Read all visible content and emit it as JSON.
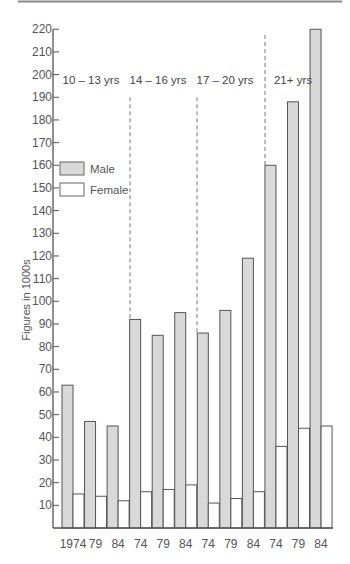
{
  "chart_data": {
    "type": "bar",
    "title": "",
    "xlabel": "",
    "ylabel": "Figures in 1000s",
    "ylim": [
      0,
      220
    ],
    "yticks": [
      10,
      20,
      30,
      40,
      50,
      60,
      70,
      80,
      90,
      100,
      110,
      120,
      130,
      140,
      150,
      160,
      170,
      180,
      190,
      200,
      210,
      220
    ],
    "grid": false,
    "legend_position": "upper-left",
    "categories": [
      "1974",
      "79",
      "84",
      "74",
      "79",
      "84",
      "74",
      "79",
      "84",
      "74",
      "79",
      "84"
    ],
    "groups": [
      {
        "label": "10 – 13 yrs",
        "categories": [
          "1974",
          "79",
          "84"
        ]
      },
      {
        "label": "14 – 16 yrs",
        "categories": [
          "74",
          "79",
          "84"
        ]
      },
      {
        "label": "17 – 20 yrs",
        "categories": [
          "74",
          "79",
          "84"
        ]
      },
      {
        "label": "21+ yrs",
        "categories": [
          "74",
          "79",
          "84"
        ]
      }
    ],
    "series": [
      {
        "name": "Male",
        "color": "#d9d9d9",
        "values": [
          63,
          47,
          45,
          92,
          85,
          95,
          86,
          96,
          119,
          160,
          188,
          220
        ]
      },
      {
        "name": "Female",
        "color": "#ffffff",
        "values": [
          15,
          14,
          12,
          16,
          17,
          19,
          11,
          13,
          16,
          36,
          44,
          45
        ]
      }
    ]
  },
  "legend": {
    "male_label": "Male",
    "female_label": "Female"
  },
  "colors": {
    "axis": "#555555",
    "male_fill": "#d9d9d9",
    "female_fill": "#ffffff",
    "bar_stroke": "#555555",
    "divider": "#777777"
  }
}
